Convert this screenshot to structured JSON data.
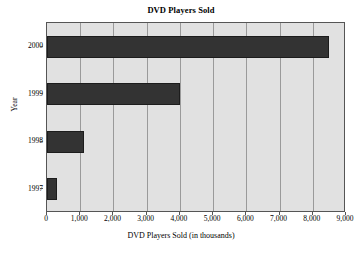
{
  "chart_data": {
    "type": "bar",
    "orientation": "horizontal",
    "title": "DVD Players Sold",
    "xlabel": "DVD Players Sold (in thousands)",
    "ylabel": "Year",
    "categories": [
      "2000",
      "1999",
      "1998",
      "1997"
    ],
    "values": [
      8500,
      4000,
      1100,
      300
    ],
    "series": [
      {
        "name": "DVD Players Sold",
        "values": [
          8500,
          4000,
          1100,
          300
        ]
      }
    ],
    "xlim": [
      0,
      9000
    ],
    "xticks": [
      0,
      1000,
      2000,
      3000,
      4000,
      5000,
      6000,
      7000,
      8000,
      9000
    ],
    "xtick_labels": [
      "0",
      "1,000",
      "2,000",
      "3,000",
      "4,000",
      "5,000",
      "6,000",
      "7,000",
      "8,000",
      "9,000"
    ],
    "ytick_labels": [
      "2000",
      "1999",
      "1998",
      "1997"
    ],
    "grid": true,
    "grid_axis": "x",
    "legend": false,
    "colors": {
      "bar": "#333333",
      "bar_edge": "#1c1c1c",
      "plot_background": "#e1e1e1",
      "gridline": "#9a9a9a",
      "axis": "#555555",
      "page_background": "#ffffff",
      "text": "#000000"
    }
  }
}
